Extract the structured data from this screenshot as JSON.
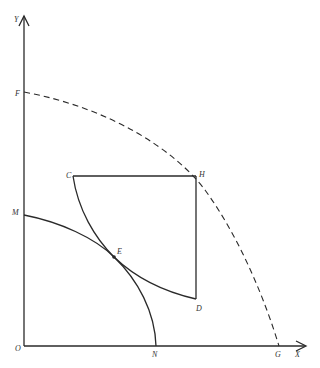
{
  "diagram": {
    "type": "production-possibility / consumption diagram",
    "axes": {
      "x_label": "X",
      "y_label": "Y",
      "origin_label": "O"
    },
    "points": {
      "F": "F",
      "G": "G",
      "M": "M",
      "N": "N",
      "C": "C",
      "H": "H",
      "D": "D",
      "E": "E"
    },
    "curves": [
      {
        "name": "FG",
        "style": "dashed",
        "description": "Outer concave curve from F on Y-axis to G on X-axis, passing through H"
      },
      {
        "name": "MN",
        "style": "solid",
        "description": "Inner concave curve from M on Y-axis to N on X-axis, passing through E"
      },
      {
        "name": "CD",
        "style": "solid",
        "description": "Convex curve from C to D, tangent to MN at E"
      }
    ],
    "segments": [
      {
        "name": "CH",
        "style": "solid",
        "description": "Horizontal line from C to H"
      },
      {
        "name": "HD",
        "style": "solid",
        "description": "Vertical line from H to D"
      }
    ]
  }
}
